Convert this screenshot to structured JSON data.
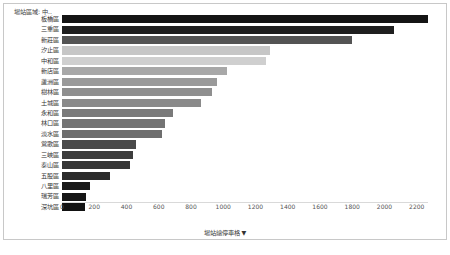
{
  "panel": {
    "legend_header": "場站區域: 中..",
    "background": "#ffffff",
    "border_color": "#c8c8c8"
  },
  "axis": {
    "title": "場站總停車格 ▼",
    "ticks": [
      "0",
      "200",
      "400",
      "600",
      "800",
      "1000",
      "1200",
      "1400",
      "1600",
      "1800",
      "2000",
      "2200"
    ]
  },
  "chart_data": {
    "type": "bar",
    "orientation": "horizontal",
    "title": "",
    "xlabel": "場站總停車格 ▼",
    "ylabel": "",
    "xlim": [
      0,
      2270
    ],
    "grid": false,
    "legend": "場站區域: 中..",
    "tick_values": [
      0,
      200,
      400,
      600,
      800,
      1000,
      1200,
      1400,
      1600,
      1800,
      2000,
      2200
    ],
    "categories": [
      "板橋區",
      "三重區",
      "新莊區",
      "汐止區",
      "中和區",
      "新店區",
      "蘆洲區",
      "樹林區",
      "土城區",
      "永和區",
      "林口區",
      "淡水區",
      "鶯歌區",
      "三峽區",
      "泰山區",
      "五股區",
      "八里區",
      "瑞芳區",
      "深坑區"
    ],
    "values": [
      2270,
      2060,
      1800,
      1290,
      1265,
      1025,
      960,
      930,
      865,
      690,
      640,
      620,
      460,
      440,
      420,
      300,
      175,
      150,
      140
    ],
    "bar_colors": [
      "#141414",
      "#1f1f1f",
      "#545454",
      "#c6c6c6",
      "#cfcfcf",
      "#a8a8a8",
      "#9a9a9a",
      "#8f8f8f",
      "#8a8a8a",
      "#7a7a7a",
      "#747474",
      "#6e6e6e",
      "#4a4a4a",
      "#3d3d3d",
      "#363636",
      "#2b2b2b",
      "#1a1a1a",
      "#161616",
      "#121212"
    ]
  }
}
